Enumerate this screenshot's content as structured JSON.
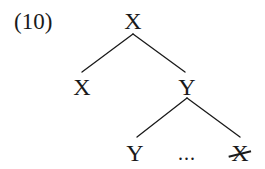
{
  "example": {
    "number_label": "(10)"
  },
  "tree": {
    "root": {
      "label": "X"
    },
    "level1": {
      "left": {
        "label": "X"
      },
      "right": {
        "label": "Y"
      }
    },
    "level2": {
      "left": {
        "label": "Y"
      },
      "ellipsis": "...",
      "right": {
        "label": "X",
        "struck_through": true
      }
    }
  },
  "colors": {
    "ink": "#1a1a1a",
    "background": "#ffffff"
  }
}
